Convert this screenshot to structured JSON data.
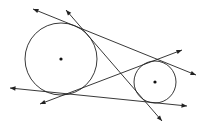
{
  "diagram": {
    "background": "#ffffff",
    "stroke_color": "#222222",
    "circles": [
      {
        "name": "large-circle",
        "cx": 61,
        "cy": 59,
        "r": 36,
        "center_dot": true
      },
      {
        "name": "small-circle",
        "cx": 155,
        "cy": 82,
        "r": 21,
        "center_dot": true
      }
    ],
    "lines": [
      {
        "name": "external-tangent-top",
        "x1": 33,
        "y1": 9,
        "x2": 196,
        "y2": 75,
        "arrow_start": true,
        "arrow_end": true
      },
      {
        "name": "internal-tangent-steep",
        "x1": 66,
        "y1": 10,
        "x2": 162,
        "y2": 121,
        "arrow_start": true,
        "arrow_end": true
      },
      {
        "name": "internal-tangent-shallow",
        "x1": 40,
        "y1": 104,
        "x2": 182,
        "y2": 50,
        "arrow_start": true,
        "arrow_end": true
      },
      {
        "name": "external-tangent-bottom",
        "x1": 10,
        "y1": 88,
        "x2": 187,
        "y2": 106,
        "arrow_start": true,
        "arrow_end": true
      }
    ],
    "tangent_count": 4
  }
}
